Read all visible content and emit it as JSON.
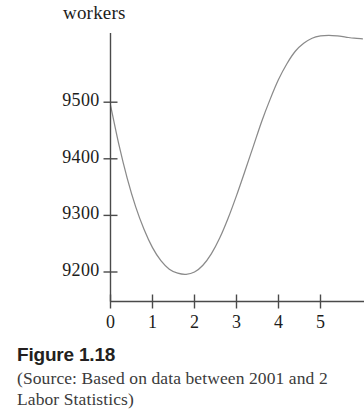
{
  "figure": {
    "number_label": "Figure 1.18",
    "source_line_1": "(Source: Based on data between 2001 and 2",
    "source_line_2": "Labor Statistics)"
  },
  "chart_data": {
    "type": "line",
    "title": "",
    "ylabel": "workers",
    "xlabel": "",
    "ylim": [
      9150,
      9620
    ],
    "xlim": [
      -0.12,
      6.1
    ],
    "grid": false,
    "legend": null,
    "y_ticks": [
      9200,
      9300,
      9400,
      9500
    ],
    "y_tick_labels": [
      "9200",
      "9300",
      "9400",
      "9500"
    ],
    "x_ticks": [
      0,
      1,
      2,
      3,
      4,
      5
    ],
    "x_tick_labels": [
      "0",
      "1",
      "2",
      "3",
      "4",
      "5"
    ],
    "series": [
      {
        "name": "workers",
        "color": "#8a8a8a",
        "x": [
          0.0,
          0.2,
          0.4,
          0.6,
          0.8,
          1.0,
          1.2,
          1.4,
          1.6,
          1.8,
          2.0,
          2.2,
          2.4,
          2.6,
          2.8,
          3.0,
          3.2,
          3.4,
          3.6,
          3.8,
          4.0,
          4.2,
          4.4,
          4.6,
          4.8,
          5.0,
          5.2,
          5.4,
          5.6,
          5.8,
          6.0
        ],
        "y": [
          9495,
          9425,
          9365,
          9315,
          9275,
          9243,
          9220,
          9205,
          9198,
          9196,
          9200,
          9212,
          9232,
          9260,
          9295,
          9335,
          9378,
          9422,
          9466,
          9505,
          9540,
          9568,
          9590,
          9604,
          9613,
          9617,
          9618,
          9617,
          9615,
          9613,
          9612
        ]
      }
    ],
    "minimum": {
      "x": 1.8,
      "y": 9196
    },
    "start_point": {
      "x": 0,
      "y": 9495
    }
  }
}
